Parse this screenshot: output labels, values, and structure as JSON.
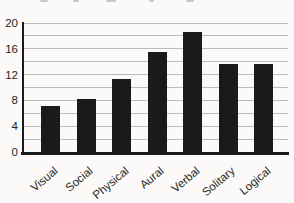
{
  "figure": {
    "background_color": "#fbfaf8",
    "bar_color": "#1c1a19",
    "gridline_color": "#bcbcba",
    "axis_color": "#1b1a18",
    "label_color": "#262624"
  },
  "chart_data": {
    "type": "bar",
    "categories": [
      "Visual",
      "Social",
      "Physical",
      "Aural",
      "Verbal",
      "Solitary",
      "Logical"
    ],
    "values": [
      7.2,
      8.2,
      11.3,
      15.5,
      18.6,
      13.7,
      13.6
    ],
    "title": "",
    "xlabel": "",
    "ylabel": "",
    "ylim": [
      0,
      20
    ],
    "yticks": [
      0,
      4,
      8,
      12,
      16,
      20
    ],
    "gridline_interval": 2,
    "grid": true,
    "legend": "none",
    "bar_style": "solid black",
    "x_label_rotation_deg": -40
  }
}
